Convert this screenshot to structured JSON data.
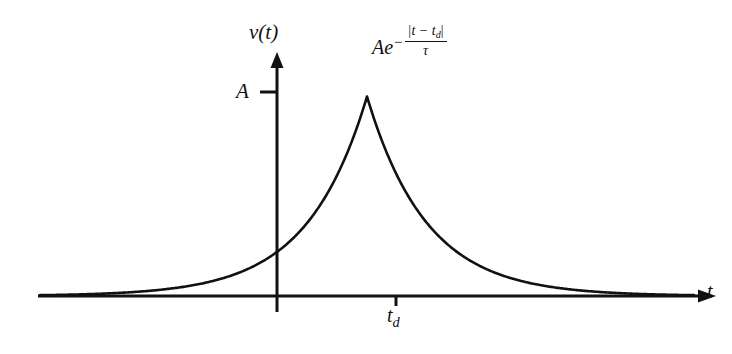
{
  "figure": {
    "name": "two-sided-exponential-pulse",
    "background_color": "#ffffff",
    "ink_color": "#111111",
    "axis": {
      "y_label": "v(t)",
      "x_label": "t",
      "amplitude_tick_label": "A",
      "center_tick_label": "t",
      "center_tick_subscript": "d"
    },
    "expression": {
      "base": "Ae",
      "exponent_sign": "−",
      "numerator": "|t − t",
      "numerator_subscript": "d",
      "numerator_close": "|",
      "denominator": "τ"
    }
  },
  "chart_data": {
    "type": "line",
    "title": "",
    "xlabel": "t",
    "ylabel": "v(t)",
    "legend": [],
    "grid": false,
    "annotations": [
      {
        "text": "Ae^{-|t-t_d|/τ}",
        "x": 3.0,
        "y": 1.12
      },
      {
        "text": "A",
        "x": -3.6,
        "y": 1.0
      },
      {
        "text": "t_d",
        "x": 3.0,
        "y": -0.12
      }
    ],
    "axis_ticks": {
      "x": [
        {
          "value": 3.0,
          "label": "t_d"
        }
      ],
      "y": [
        {
          "value": 1.0,
          "label": "A"
        }
      ]
    },
    "xlim": [
      -6.6,
      12.6
    ],
    "ylim": [
      0,
      1.28
    ],
    "function": "A*exp(-|t - t_d|/tau)",
    "parameters": {
      "A": 1.0,
      "t_d": 3.0,
      "tau": 1.75
    },
    "x": [
      -6.6,
      -6.0,
      -5.4,
      -4.8,
      -4.2,
      -3.6,
      -3.0,
      -2.4,
      -1.8,
      -1.2,
      -0.6,
      0.0,
      0.6,
      1.2,
      1.8,
      2.4,
      3.0,
      3.6,
      4.2,
      4.8,
      5.4,
      6.0,
      6.6,
      7.2,
      7.8,
      8.4,
      9.0,
      9.6,
      10.2,
      10.8,
      11.4,
      12.0,
      12.6
    ],
    "y": [
      0.0033,
      0.0047,
      0.0067,
      0.0095,
      0.0134,
      0.019,
      0.0269,
      0.0381,
      0.0539,
      0.0763,
      0.108,
      0.1529,
      0.2163,
      0.3061,
      0.4332,
      0.6131,
      1.0,
      0.6131,
      0.4332,
      0.3061,
      0.2163,
      0.1529,
      0.108,
      0.0763,
      0.0539,
      0.0381,
      0.0269,
      0.019,
      0.0134,
      0.0095,
      0.0067,
      0.0047,
      0.0033
    ]
  }
}
